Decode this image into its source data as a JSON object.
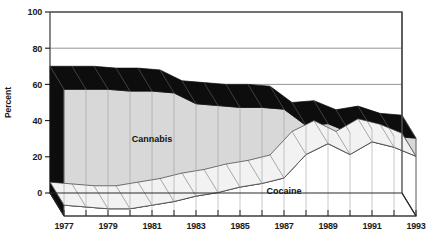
{
  "chart_data": {
    "type": "area",
    "title": "",
    "xlabel": "",
    "ylabel": "Percent",
    "ylim": [
      0,
      100
    ],
    "yticks": [
      0,
      20,
      40,
      60,
      80,
      100
    ],
    "ytick_labels": [
      "0",
      "20",
      "40",
      "60",
      "80",
      "100"
    ],
    "x": [
      1977,
      1978,
      1979,
      1980,
      1981,
      1982,
      1983,
      1984,
      1985,
      1986,
      1987,
      1988,
      1989,
      1990,
      1991,
      1992,
      1993
    ],
    "xtick_labels": [
      "1977",
      "1979",
      "1981",
      "1983",
      "1985",
      "1987",
      "1989",
      "1991",
      "1993"
    ],
    "grid": true,
    "legend_position": "inline-annotation",
    "style": "3d-ribbon-area",
    "series": [
      {
        "name": "Cannabis",
        "color": "#d8d8d8",
        "top_color": "#0d0d0d",
        "values": [
          70,
          70,
          70,
          69,
          69,
          68,
          62,
          61,
          60,
          60,
          59,
          50,
          51,
          46,
          48,
          44,
          43
        ]
      },
      {
        "name": "Cocaine",
        "color": "#ffffff",
        "top_color": "#0d0d0d",
        "values": [
          6,
          5,
          4,
          4,
          6,
          8,
          11,
          13,
          16,
          18,
          21,
          34,
          40,
          34,
          41,
          38,
          33
        ]
      }
    ],
    "annotations": [
      {
        "text": "Cannabis",
        "x": 1981,
        "y": 41
      },
      {
        "text": "Cocaine",
        "x": 1987,
        "y": 12
      }
    ]
  },
  "colors": {
    "frame": "#555555",
    "gridline": "#8a8a8a",
    "cannabis_fill": "#d8d8d8",
    "cocaine_fill": "#ffffff",
    "ribbon_top": "#0d0d0d",
    "text": "#1a1a1a",
    "background": "#ffffff"
  }
}
